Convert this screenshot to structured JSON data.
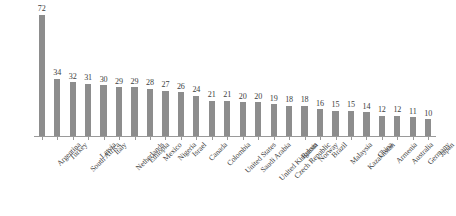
{
  "chart_data": {
    "type": "bar",
    "title": "",
    "subtitle": "",
    "xlabel": "",
    "ylabel": "",
    "ylim": [
      0,
      76
    ],
    "grid": false,
    "legend": false,
    "legend_position": "none",
    "orientation": "vertical",
    "value_labels_shown": true,
    "bar_color": "#8d8d8d",
    "axis_color": "#9a9a9a",
    "text_color": "#3d3d3d",
    "background_color": "#ffffff",
    "x_tick_labels_rotation": -45,
    "categories": [
      "Argentina",
      "Turkey",
      "South Africa",
      "Latvia",
      "Italy",
      "Netherlands",
      "Ethiopia",
      "Mexico",
      "Nigeria",
      "Israel",
      "Canada",
      "Colombia",
      "United States",
      "Saudi Arabia",
      "United Kingdom",
      "Czech Republic",
      "Russia",
      "Norway",
      "Brazil",
      "Malaysia",
      "Kazakhstan",
      "China",
      "Armenia",
      "Australia",
      "Germany",
      "Japan"
    ],
    "values": [
      72,
      34,
      32,
      31,
      30,
      29,
      29,
      28,
      27,
      26,
      24,
      21,
      21,
      20,
      20,
      19,
      18,
      18,
      16,
      15,
      15,
      14,
      12,
      12,
      11,
      10
    ],
    "series": [
      {
        "name": "",
        "values": [
          72,
          34,
          32,
          31,
          30,
          29,
          29,
          28,
          27,
          26,
          24,
          21,
          21,
          20,
          20,
          19,
          18,
          18,
          16,
          15,
          15,
          14,
          12,
          12,
          11,
          10
        ]
      }
    ]
  }
}
